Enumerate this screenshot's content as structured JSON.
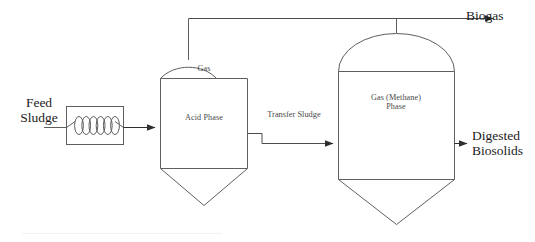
{
  "diagram": {
    "background_color": "#ffffff",
    "line_color": "#595959",
    "text_color": "#2b2b2b",
    "labels": {
      "feed_sludge": "Feed\nSludge",
      "biogas": "Biogas",
      "digested_biosolids": "Digested\nBiosolids",
      "transfer_sludge": "Transfer Sludge"
    },
    "heat_exchanger": {
      "name": "heat-exchanger",
      "symbol": "coil",
      "coil_loops": 6
    },
    "vessels": [
      {
        "id": "acid-phase-digester",
        "headspace_label": "Gas",
        "body_label": "Acid Phase",
        "top": "dome",
        "bottom": "cone"
      },
      {
        "id": "methane-phase-digester",
        "headspace_label": "",
        "body_label": "Gas (Methane)\nPhase",
        "body_label_line1": "Gas (Methane)",
        "body_label_line2": "Phase",
        "top": "dome",
        "bottom": "cone"
      }
    ],
    "streams": [
      {
        "id": "feed-sludge-stream",
        "label": "Feed Sludge",
        "from": "inlet",
        "to": "heat-exchanger"
      },
      {
        "id": "heated-sludge-stream",
        "label": "",
        "from": "heat-exchanger",
        "to": "acid-phase-digester"
      },
      {
        "id": "transfer-sludge-stream",
        "label": "Transfer Sludge",
        "from": "acid-phase-digester",
        "to": "methane-phase-digester"
      },
      {
        "id": "acid-gas-riser",
        "label": "",
        "from": "acid-phase-digester",
        "to": "biogas-header"
      },
      {
        "id": "methane-gas-riser",
        "label": "",
        "from": "methane-phase-digester",
        "to": "biogas-header"
      },
      {
        "id": "biogas-stream",
        "label": "Biogas",
        "from": "biogas-header",
        "to": "outlet"
      },
      {
        "id": "digested-biosolids-stream",
        "label": "Digested Biosolids",
        "from": "methane-phase-digester",
        "to": "outlet"
      }
    ]
  }
}
